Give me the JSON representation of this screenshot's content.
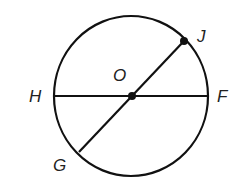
{
  "diagram": {
    "type": "circle-geometry",
    "colors": {
      "stroke": "#111111",
      "label": "#222222",
      "background": "#ffffff"
    },
    "circle": {
      "center": "O",
      "cx": 131,
      "cy": 96,
      "rx": 77,
      "ry": 80
    },
    "points": {
      "O": {
        "label": "O",
        "x": 132,
        "y": 96,
        "label_x": 113,
        "label_y": 81,
        "marked": true
      },
      "J": {
        "label": "J",
        "x": 184,
        "y": 41,
        "label_x": 197,
        "label_y": 42,
        "marked": true
      },
      "H": {
        "label": "H",
        "x": 54,
        "y": 96,
        "label_x": 29,
        "label_y": 102,
        "marked": false
      },
      "F": {
        "label": "F",
        "x": 208,
        "y": 96,
        "label_x": 217,
        "label_y": 102,
        "marked": false
      },
      "G": {
        "label": "G",
        "x": 79,
        "y": 152,
        "label_x": 53,
        "label_y": 171,
        "marked": false
      }
    },
    "segments": [
      {
        "name": "HF",
        "from": "H",
        "to": "F"
      },
      {
        "name": "GJ",
        "from": "G",
        "to": "J"
      }
    ]
  }
}
